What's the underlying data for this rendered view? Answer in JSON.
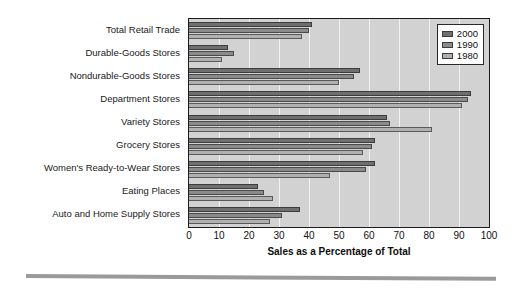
{
  "chart_data": {
    "type": "bar",
    "orientation": "horizontal",
    "title": "",
    "xlabel": "Sales as a Percentage of Total",
    "ylabel": "",
    "xlim": [
      0,
      100
    ],
    "xticks": [
      0,
      10,
      20,
      30,
      40,
      50,
      60,
      70,
      80,
      90,
      100
    ],
    "grid": true,
    "grid_axis": "x",
    "legend_position": "top-right",
    "categories": [
      "Total Retail Trade",
      "Durable-Goods Stores",
      "Nondurable-Goods Stores",
      "Department Stores",
      "Variety Stores",
      "Grocery Stores",
      "Women's Ready-to-Wear Stores",
      "Eating Places",
      "Auto and Home Supply Stores"
    ],
    "series": [
      {
        "name": "2000",
        "color": "#6f6f6f",
        "values": [
          41,
          13,
          57,
          94,
          66,
          62,
          62,
          23,
          37
        ]
      },
      {
        "name": "1990",
        "color": "#8a8a8a",
        "values": [
          40,
          15,
          55,
          93,
          67,
          61,
          59,
          25,
          31
        ]
      },
      {
        "name": "1980",
        "color": "#b0b0b0",
        "values": [
          37.5,
          11,
          50,
          91,
          81,
          58,
          47,
          28,
          27
        ]
      }
    ]
  },
  "legend": {
    "entries": [
      {
        "label": "2000",
        "swatch": "s2000"
      },
      {
        "label": "1990",
        "swatch": "s1990"
      },
      {
        "label": "1980",
        "swatch": "s1980"
      }
    ]
  },
  "axis": {
    "x_title": "Sales as a Percentage of Total",
    "x_tick_labels": [
      "0",
      "10",
      "20",
      "30",
      "40",
      "50",
      "60",
      "70",
      "80",
      "90",
      "100"
    ]
  }
}
